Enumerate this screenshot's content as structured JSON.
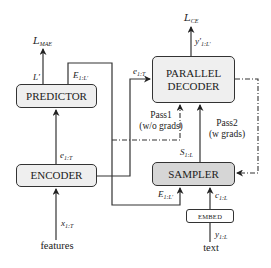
{
  "diagram": {
    "boxes": {
      "predictor": "PREDICTOR",
      "parallel_decoder_line1": "PARALLEL",
      "parallel_decoder_line2": "DECODER",
      "encoder": "ENCODER",
      "sampler": "SAMPLER",
      "embed": "EMBED"
    },
    "losses": {
      "mae_main": "L",
      "mae_sub": "MAE",
      "ce_main": "L",
      "ce_sub": "CE"
    },
    "edge_labels": {
      "l_prime": "L′",
      "e_pred_main": "E",
      "e_pred_sub": "1:L′",
      "e_enc_main": "e",
      "e_enc_sub": "1:T",
      "e_dec_main": "e",
      "e_dec_sub": "1:T",
      "y_out_main": "y′",
      "y_out_sub": "1:L′",
      "s_main": "S",
      "s_sub": "1:L",
      "e_samp_main": "E",
      "e_samp_sub": "1:L′",
      "c_main": "c",
      "c_sub": "1:L",
      "y_in_main": "y",
      "y_in_sub": "1:L",
      "x_main": "x",
      "x_sub": "1:T"
    },
    "pass_labels": {
      "pass1_line1": "Pass1",
      "pass1_line2": "(w/o grads)",
      "pass2_line1": "Pass2",
      "pass2_line2": "(w grads)"
    },
    "inputs": {
      "features": "features",
      "text": "text"
    },
    "colors": {
      "line": "#333333",
      "box_light": "#efefef",
      "box_dark": "#d6d6d6"
    }
  }
}
